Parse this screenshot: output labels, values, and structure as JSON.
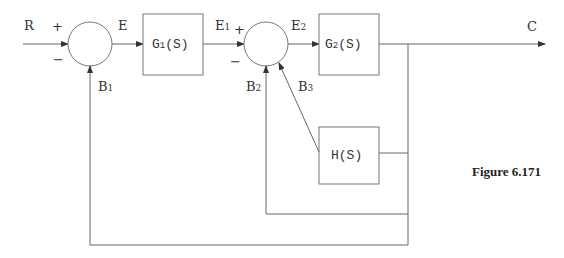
{
  "diagram": {
    "type": "control-system block diagram",
    "caption": "Figure 6.171",
    "input_label": "R",
    "output_label": "C",
    "summing_junctions": [
      {
        "id": "sum1",
        "plus_sign": "+",
        "minus_sign": "−",
        "output_label": "E",
        "feedback_label": "B1"
      },
      {
        "id": "sum2",
        "plus_sign": "+",
        "minus_sign": "−",
        "output_label": "E2",
        "feedback_labels": [
          "B2",
          "B3"
        ]
      }
    ],
    "blocks": [
      {
        "id": "G1",
        "label": "G1(S)",
        "input": "E",
        "output": "E1"
      },
      {
        "id": "G2",
        "label": "G2(S)",
        "input": "E2",
        "output": "C"
      },
      {
        "id": "H",
        "label": "H(S)",
        "input": "C",
        "output": "B3"
      }
    ],
    "signals": {
      "R": "R",
      "E": "E",
      "E1": "E1",
      "E2": "E2",
      "C": "C",
      "B1": "B1",
      "B2": "B2",
      "B3": "B3"
    },
    "labels": {
      "R": "R",
      "E": "E",
      "E1_main": "E",
      "E1_sub": "1",
      "E2_main": "E",
      "E2_sub": "2",
      "C": "C",
      "B1_main": "B",
      "B1_sub": "1",
      "B2_main": "B",
      "B2_sub": "2",
      "B3_main": "B",
      "B3_sub": "3",
      "G1_main": "G",
      "G1_sub": "1",
      "G1_arg": "(S)",
      "G2_main": "G",
      "G2_sub": "2",
      "G2_arg": "(S)",
      "H": "H(S)",
      "plus": "+",
      "minus": "−"
    }
  }
}
